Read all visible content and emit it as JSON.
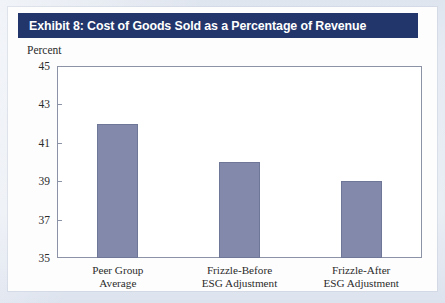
{
  "exhibit": {
    "title": "Exhibit 8: Cost of Goods Sold as a Percentage of Revenue",
    "title_bar_color": "#22366b",
    "title_text_color": "#ffffff"
  },
  "chart_data": {
    "type": "bar",
    "title": "Exhibit 8: Cost of Goods Sold as a Percentage of Revenue",
    "xlabel": "",
    "ylabel": "Percent",
    "categories": [
      "Peer Group Average",
      "Frizzle-Before ESG Adjustment",
      "Frizzle-After ESG Adjustment"
    ],
    "category_lines": [
      [
        "Peer Group",
        "Average"
      ],
      [
        "Frizzle-Before",
        "ESG Adjustment"
      ],
      [
        "Frizzle-After",
        "ESG Adjustment"
      ]
    ],
    "values": [
      42,
      40,
      39
    ],
    "ylim": [
      35,
      45
    ],
    "yticks": [
      45,
      43,
      41,
      39,
      37,
      35
    ],
    "ytick_labels": [
      "45",
      "43",
      "41",
      "39",
      "37",
      "35"
    ],
    "grid": false,
    "legend": "none",
    "bar_color": "#8289ab",
    "bar_edge_color": "#6f7798",
    "axis_color": "#8d93a6"
  }
}
